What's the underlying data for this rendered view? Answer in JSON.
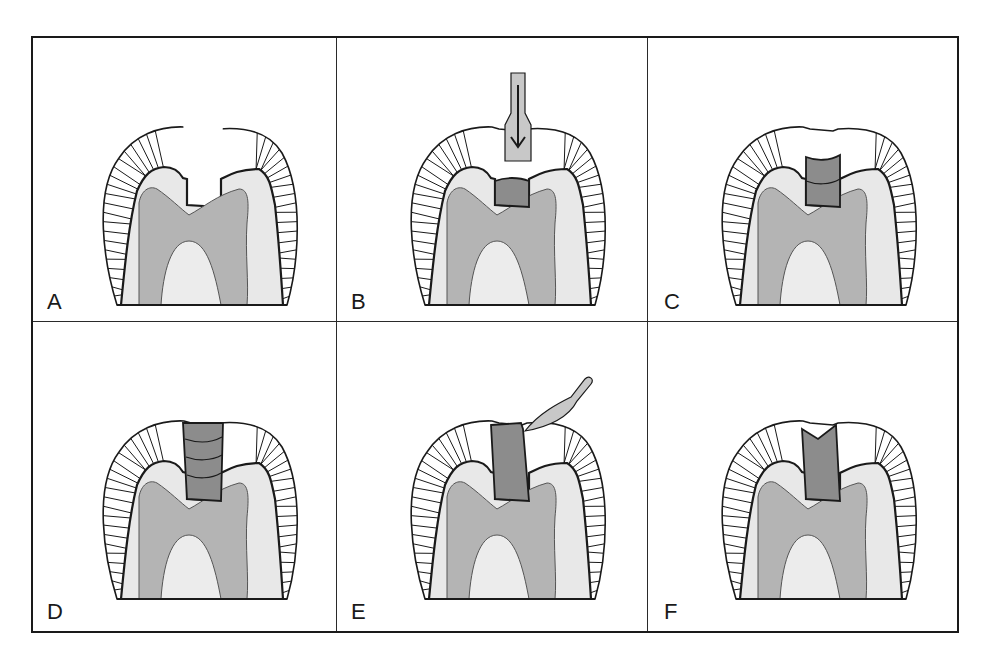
{
  "figure": {
    "panel_labels": [
      "A",
      "B",
      "C",
      "D",
      "E",
      "F"
    ],
    "colors": {
      "outline": "#1a1a1a",
      "enamel": "#ffffff",
      "dentin": "#e8e8e8",
      "pulp_band": "#b4b4b4",
      "pulp_core": "#ececec",
      "restoration": "#8c8c8c",
      "instrument": "#c8c8c8"
    }
  },
  "panels": [
    {
      "id": "A",
      "label": "A",
      "stage": "prepared cavity",
      "restoration": "none",
      "increments": 0,
      "instrument": "none"
    },
    {
      "id": "B",
      "label": "B",
      "stage": "first increment condensed",
      "restoration": "base",
      "increments": 1,
      "instrument": "plugger-with-down-arrow"
    },
    {
      "id": "C",
      "label": "C",
      "stage": "second increment added",
      "restoration": "layered",
      "increments": 2,
      "instrument": "none"
    },
    {
      "id": "D",
      "label": "D",
      "stage": "cavity overfilled in layers",
      "restoration": "overfilled",
      "increments": 4,
      "instrument": "none"
    },
    {
      "id": "E",
      "label": "E",
      "stage": "carving excess",
      "restoration": "carving",
      "increments": 1,
      "instrument": "carver"
    },
    {
      "id": "F",
      "label": "F",
      "stage": "final anatomic restoration",
      "restoration": "final",
      "increments": 1,
      "instrument": "none"
    }
  ]
}
